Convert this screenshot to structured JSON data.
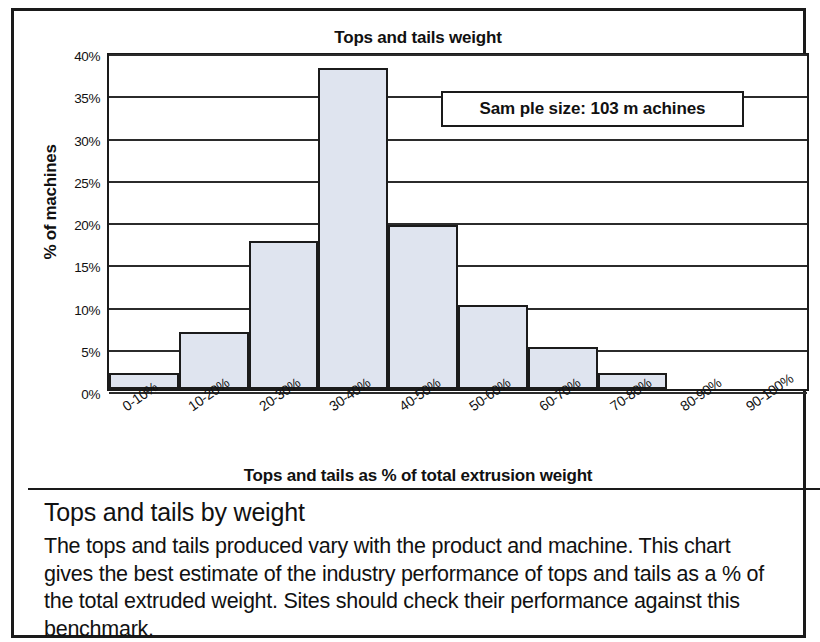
{
  "document": {
    "caption_heading": "Tops and tails by weight",
    "caption_body": "The tops and tails produced vary with the product and machine. This chart gives the best estimate of the industry performance of tops and tails as a % of the total extruded weight. Sites should check their performance against this benchmark."
  },
  "chart_data": {
    "type": "bar",
    "title": "Tops and tails weight",
    "xlabel": "Tops and tails as % of total extrusion weight",
    "ylabel": "% of machines",
    "categories": [
      "0-10%",
      "10-20%",
      "20-30%",
      "30-40%",
      "40-50%",
      "50-60%",
      "60-70%",
      "70-80%",
      "80-90%",
      "90-100%"
    ],
    "values": [
      1.9,
      6.8,
      17.5,
      38.0,
      19.4,
      10.0,
      5.0,
      1.9,
      0.0,
      0.0
    ],
    "ylim": [
      0,
      40
    ],
    "ytick_labels": [
      "0%",
      "5%",
      "10%",
      "15%",
      "20%",
      "25%",
      "30%",
      "35%",
      "40%"
    ],
    "ytick_values": [
      0,
      5,
      10,
      15,
      20,
      25,
      30,
      35,
      40
    ],
    "grid": true,
    "legend": "none",
    "annotations": [
      {
        "name": "sample-size",
        "text": "Sam ple size: 103 m achines"
      }
    ],
    "bar_fill_color": "#dfe4ef",
    "bar_border_color": "#1b1b1b"
  }
}
